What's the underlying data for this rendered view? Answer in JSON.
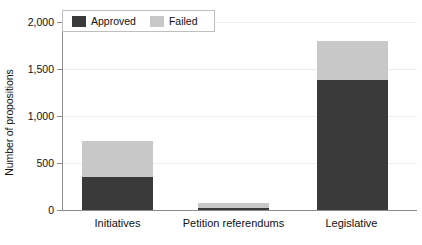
{
  "chart_data": {
    "type": "bar",
    "subtype": "stacked-vertical",
    "title": "",
    "xlabel": "",
    "ylabel": "Number of propositions",
    "categories": [
      "Initiatives",
      "Petition referendums",
      "Legislative"
    ],
    "series": [
      {
        "name": "Approved",
        "color": "#3a3a3a",
        "values": [
          350,
          25,
          1380
        ]
      },
      {
        "name": "Failed",
        "color": "#c8c8c8",
        "values": [
          380,
          50,
          420
        ]
      }
    ],
    "totals": [
      730,
      75,
      1800
    ],
    "ylim": [
      0,
      2000
    ],
    "ytick_values": [
      0,
      500,
      1000,
      1500,
      2000
    ],
    "ytick_labels": [
      "0",
      "500",
      "1,000",
      "1,500",
      "2,000"
    ],
    "grid": "horizontal",
    "legend_position": "top-left-inside",
    "legend_entries": [
      "Approved",
      "Failed"
    ]
  },
  "axes": {
    "y_title": "Number of propositions",
    "tick_labels": [
      "2,000",
      "1,500",
      "1,000",
      "500",
      "0"
    ],
    "category_labels": [
      "Initiatives",
      "Petition referendums",
      "Legislative"
    ]
  },
  "legend": {
    "items": [
      {
        "label": "Approved",
        "color": "#3a3a3a"
      },
      {
        "label": "Failed",
        "color": "#c8c8c8"
      }
    ]
  },
  "colors": {
    "approved": "#3a3a3a",
    "failed": "#c8c8c8",
    "axis": "#8d8d8d",
    "grid": "#ededed",
    "text": "#111111",
    "background": "#ffffff"
  }
}
